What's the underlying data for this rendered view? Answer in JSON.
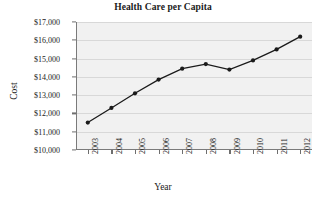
{
  "chart_data": {
    "type": "line",
    "title": "Health Care per Capita",
    "xlabel": "Year",
    "ylabel": "Cost",
    "categories": [
      "2003",
      "2004",
      "2005",
      "2006",
      "2007",
      "2008",
      "2009",
      "2010",
      "2011",
      "2012"
    ],
    "values": [
      11500,
      12300,
      13100,
      13850,
      14450,
      14700,
      14400,
      14900,
      15500,
      16200
    ],
    "ytick_labels": [
      "$10,000",
      "$11,000",
      "$12,000",
      "$13,000",
      "$14,000",
      "$15,000",
      "$16,000",
      "$17,000"
    ],
    "ytick_values": [
      10000,
      11000,
      12000,
      13000,
      14000,
      15000,
      16000,
      17000
    ],
    "ylim": [
      10000,
      17000
    ],
    "grid": true,
    "legend": "none",
    "marker": "filled-circle",
    "line_color": "#1a1a1a",
    "marker_color": "#1a1a1a",
    "plot_background": "#f1f1f1",
    "gridline_color": "#d8d8d8",
    "axis_color": "#7a7a7a"
  }
}
